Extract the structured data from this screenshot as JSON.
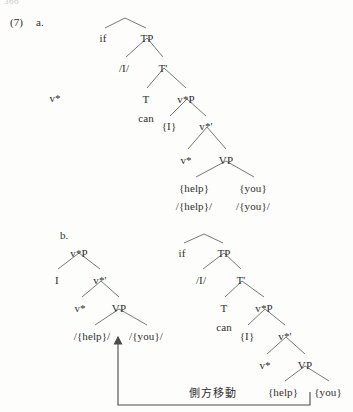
{
  "page": {
    "number": "366",
    "language_note": "側方移動"
  },
  "example": {
    "number": "(7)",
    "sub_a": "a.",
    "sub_b": "b."
  },
  "tree_a": {
    "floating_label": "v*",
    "nodes": [
      {
        "label": "if",
        "x": 103,
        "y": 33
      },
      {
        "label": "TP",
        "x": 147,
        "y": 33
      },
      {
        "label": "/I/",
        "x": 124,
        "y": 63
      },
      {
        "label": "T'",
        "x": 163,
        "y": 63
      },
      {
        "label": "T",
        "x": 146,
        "y": 94
      },
      {
        "label": "v*P",
        "x": 186,
        "y": 94
      },
      {
        "label": "can",
        "x": 146,
        "y": 113
      },
      {
        "label": "{I}",
        "x": 169,
        "y": 121
      },
      {
        "label": "v*'",
        "x": 206,
        "y": 121
      },
      {
        "label": "v*",
        "x": 186,
        "y": 155
      },
      {
        "label": "VP",
        "x": 226,
        "y": 155
      },
      {
        "label": "{help}",
        "x": 194,
        "y": 183
      },
      {
        "label": "{you}",
        "x": 253,
        "y": 183
      },
      {
        "label": "/{help}/",
        "x": 194,
        "y": 201
      },
      {
        "label": "/{you}/",
        "x": 253,
        "y": 201
      }
    ]
  },
  "tree_b_left": {
    "nodes": [
      {
        "label": "v*P",
        "x": 79,
        "y": 248
      },
      {
        "label": "I",
        "x": 57,
        "y": 275
      },
      {
        "label": "v*'",
        "x": 100,
        "y": 275
      },
      {
        "label": "v*",
        "x": 80,
        "y": 303
      },
      {
        "label": "VP",
        "x": 119,
        "y": 303
      },
      {
        "label": "/{help}/",
        "x": 92,
        "y": 331
      },
      {
        "label": "/{you}/",
        "x": 146,
        "y": 331
      }
    ]
  },
  "tree_b_right": {
    "nodes": [
      {
        "label": "if",
        "x": 182,
        "y": 248
      },
      {
        "label": "TP",
        "x": 224,
        "y": 248
      },
      {
        "label": "/I/",
        "x": 201,
        "y": 275
      },
      {
        "label": "T'",
        "x": 241,
        "y": 275
      },
      {
        "label": "T",
        "x": 224,
        "y": 303
      },
      {
        "label": "v*P",
        "x": 264,
        "y": 303
      },
      {
        "label": "can",
        "x": 224,
        "y": 322
      },
      {
        "label": "{I}",
        "x": 247,
        "y": 331
      },
      {
        "label": "v*'",
        "x": 285,
        "y": 331
      },
      {
        "label": "v*",
        "x": 265,
        "y": 360
      },
      {
        "label": "VP",
        "x": 305,
        "y": 360
      },
      {
        "label": "{help}",
        "x": 283,
        "y": 387
      },
      {
        "label": "{you}",
        "x": 328,
        "y": 387
      }
    ]
  },
  "annotation": {
    "movement_label": "側方移動"
  },
  "colors": {
    "ink": "#2f2f2f",
    "line": "#555555",
    "page": "#fdfdfc",
    "pagenum": "#c9c9c9"
  }
}
